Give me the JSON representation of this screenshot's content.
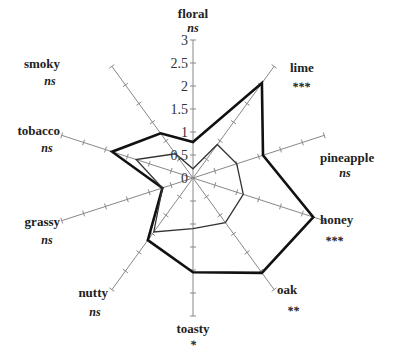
{
  "chart_data": {
    "type": "radar",
    "title": "",
    "axes": [
      "floral",
      "lime",
      "pineapple",
      "honey",
      "oak",
      "toasty",
      "nutty",
      "grassy",
      "tobacco",
      "smoky"
    ],
    "significance": [
      "ns",
      "***",
      "ns",
      "***",
      "**",
      "*",
      "ns",
      "ns",
      "ns",
      "ns"
    ],
    "rlim": [
      0,
      3
    ],
    "rticks": [
      0,
      0.5,
      1,
      1.5,
      2,
      2.5,
      3
    ],
    "rtick_labels": [
      "0",
      "0.5",
      "1",
      "1.5",
      "2",
      "2.5",
      "3"
    ],
    "series": [
      {
        "name": "series-bold",
        "style": "thick",
        "values": [
          0.78,
          2.55,
          1.6,
          2.75,
          2.55,
          2.05,
          1.67,
          0.7,
          1.85,
          1.2
        ]
      },
      {
        "name": "series-thin",
        "style": "thin",
        "values": [
          0.2,
          0.9,
          1.0,
          1.15,
          1.2,
          1.1,
          1.45,
          0.7,
          1.3,
          0.65
        ]
      }
    ],
    "grid": false,
    "legend": "none"
  },
  "colors": {
    "axis": "#888888",
    "bold_line": "#111111",
    "thin_line": "#333333",
    "text": "#222222"
  }
}
